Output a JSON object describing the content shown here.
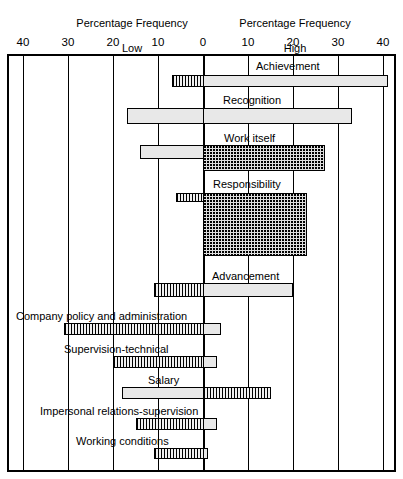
{
  "header": {
    "low_title_line1": "Percentage Frequency",
    "low_title_line2": "Low",
    "high_title_line1": "Percentage Frequency",
    "high_title_line2": "High"
  },
  "axis": {
    "tick_labels": [
      "40",
      "30",
      "20",
      "10",
      "0",
      "10",
      "20",
      "30",
      "40"
    ],
    "tick_values": [
      -40,
      -30,
      -20,
      -10,
      0,
      10,
      20,
      30,
      40
    ]
  },
  "chart_data": {
    "type": "bar",
    "title": "",
    "subtitle": "",
    "orientation": "horizontal",
    "layout": "diverging-bidirectional",
    "xlabel_left": "Percentage Frequency Low",
    "xlabel_right": "Percentage Frequency High",
    "ylabel": "",
    "xlim": [
      -40,
      40
    ],
    "grid": true,
    "gridline_interval": 10,
    "legend_position": "none",
    "categories": [
      "Achievement",
      "Recognition",
      "Work itself",
      "Responsibility",
      "Advancement",
      "Company policy and administration",
      "Supervision-technical",
      "Salary",
      "Impersonal relations-supervision",
      "Working conditions"
    ],
    "series": [
      {
        "name": "Percentage Frequency Low",
        "values": [
          -7,
          -17,
          -14,
          -6,
          -11,
          -31,
          -20,
          -18,
          -15,
          -11
        ]
      },
      {
        "name": "Percentage Frequency High",
        "values": [
          41,
          33,
          27,
          23,
          20,
          4,
          3,
          15,
          3,
          1
        ]
      }
    ],
    "bar_thickness": {
      "Achievement": "thin",
      "Recognition": "thin",
      "Work itself": "medium",
      "Responsibility": "tall",
      "Advancement": "medium",
      "Company policy and administration": "thin",
      "Supervision-technical": "thin",
      "Salary": "thin",
      "Impersonal relations-supervision": "thin",
      "Working conditions": "thin"
    }
  },
  "rows": [
    {
      "label": "Achievement",
      "label_x": 256,
      "label_y": 60,
      "bar_y": 75,
      "bar_h": 12,
      "low": -7,
      "high": 41,
      "low_style": "thin",
      "high_style": "bar"
    },
    {
      "label": "Recognition",
      "label_x": 223,
      "label_y": 94,
      "bar_y": 108,
      "bar_h": 16,
      "low": -17,
      "high": 33,
      "low_style": "bar",
      "high_style": "bar"
    },
    {
      "label": "Work itself",
      "label_x": 224,
      "label_y": 132,
      "bar_y": 145,
      "bar_h": 14,
      "low": -14,
      "high": 27,
      "low_style": "bar",
      "high_style": "dense_tall",
      "high_h": 26
    },
    {
      "label": "Responsibility",
      "label_x": 213,
      "label_y": 178,
      "bar_y": 193,
      "bar_h": 9,
      "low": -6,
      "high": 23,
      "low_style": "thin",
      "high_style": "dense_block",
      "high_h": 63
    },
    {
      "label": "Advancement",
      "label_x": 212,
      "label_y": 270,
      "bar_y": 283,
      "bar_h": 14,
      "low": -11,
      "high": 20,
      "low_style": "thin",
      "high_style": "bar"
    },
    {
      "label": "Company policy and administration",
      "label_x": 16,
      "label_y": 310,
      "bar_y": 323,
      "bar_h": 12,
      "low": -31,
      "high": 4,
      "low_style": "thin",
      "high_style": "bar"
    },
    {
      "label": "Supervision-technical",
      "label_x": 64,
      "label_y": 343,
      "bar_y": 356,
      "bar_h": 12,
      "low": -20,
      "high": 3,
      "low_style": "thin",
      "high_style": "bar"
    },
    {
      "label": "Salary",
      "label_x": 148,
      "label_y": 374,
      "bar_y": 387,
      "bar_h": 12,
      "low": -18,
      "high": 15,
      "low_style": "bar",
      "high_style": "thin"
    },
    {
      "label": "Impersonal relations-supervision",
      "label_x": 40,
      "label_y": 405,
      "bar_y": 418,
      "bar_h": 12,
      "low": -15,
      "high": 3,
      "low_style": "thin",
      "high_style": "bar"
    },
    {
      "label": "Working conditions",
      "label_x": 76,
      "label_y": 435,
      "bar_y": 448,
      "bar_h": 11,
      "low": -11,
      "high": 1,
      "low_style": "thin",
      "high_style": "bar"
    }
  ]
}
